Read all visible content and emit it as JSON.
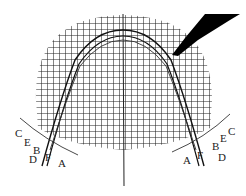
{
  "diagram": {
    "labels_left": [
      {
        "text": "C",
        "x": 15,
        "y": 128
      },
      {
        "text": "E",
        "x": 24,
        "y": 137
      },
      {
        "text": "B",
        "x": 33,
        "y": 145
      },
      {
        "text": "D",
        "x": 29,
        "y": 154
      },
      {
        "text": "F",
        "x": 45,
        "y": 152
      },
      {
        "text": "A",
        "x": 58,
        "y": 158
      }
    ],
    "labels_right": [
      {
        "text": "A",
        "x": 183,
        "y": 155
      },
      {
        "text": "F",
        "x": 197,
        "y": 150
      },
      {
        "text": "B",
        "x": 212,
        "y": 141
      },
      {
        "text": "E",
        "x": 220,
        "y": 133
      },
      {
        "text": "C",
        "x": 228,
        "y": 126
      },
      {
        "text": "D",
        "x": 218,
        "y": 152
      }
    ],
    "colors": {
      "grid": "#222222",
      "curve": "#111111",
      "background": "#ffffff"
    }
  }
}
